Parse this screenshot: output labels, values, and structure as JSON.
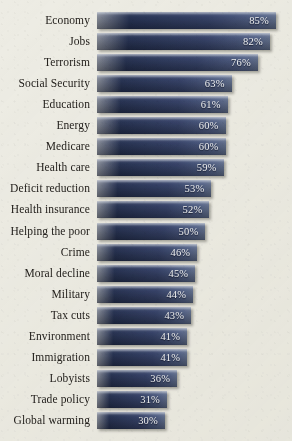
{
  "chart_data": {
    "type": "bar",
    "orientation": "horizontal",
    "title": "",
    "subtitle": "",
    "xlabel": "",
    "ylabel": "",
    "xlim": [
      0,
      100
    ],
    "grid": false,
    "legend": null,
    "value_suffix": "%",
    "categories": [
      "Economy",
      "Jobs",
      "Terrorism",
      "Social Security",
      "Education",
      "Energy",
      "Medicare",
      "Health care",
      "Deficit reduction",
      "Health insurance",
      "Helping the poor",
      "Crime",
      "Moral decline",
      "Military",
      "Tax cuts",
      "Environment",
      "Immigration",
      "Lobyists",
      "Trade policy",
      "Global warming"
    ],
    "values": [
      85,
      82,
      76,
      63,
      61,
      60,
      60,
      59,
      53,
      52,
      50,
      46,
      45,
      44,
      43,
      41,
      41,
      36,
      31,
      30
    ],
    "value_labels": [
      "85%",
      "82%",
      "76%",
      "63%",
      "61%",
      "60%",
      "60%",
      "59%",
      "53%",
      "52%",
      "50%",
      "46%",
      "45%",
      "44%",
      "43%",
      "41%",
      "41%",
      "36%",
      "31%",
      "30%"
    ],
    "colors": {
      "background": "#edece4",
      "bar_dark": "#263254",
      "bar_light": "#63718f",
      "label_text": "#24211d",
      "value_text": "#f3f4f6"
    }
  },
  "layout": {
    "bar_start_x": 97,
    "row_pitch": 21.05,
    "bar_height": 17,
    "first_bar_y": 12,
    "px_per_percent": 2.018,
    "zero_offset_px": 104.5
  }
}
